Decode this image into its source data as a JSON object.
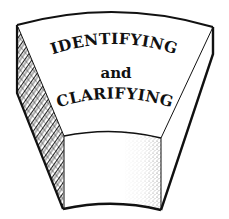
{
  "diagram": {
    "shape": "keystone-block",
    "text": {
      "line1": "IDENTIFYING",
      "line2": "and",
      "line3": "CLARIFYING"
    },
    "faces": {
      "top": "plain",
      "left_side": "hatched",
      "front": "plain-with-stippled-right-edge",
      "right_side": "plain"
    },
    "colors": {
      "stroke": "#111111",
      "background": "#ffffff",
      "hatch": "#333333",
      "stipple": "#555555"
    }
  }
}
